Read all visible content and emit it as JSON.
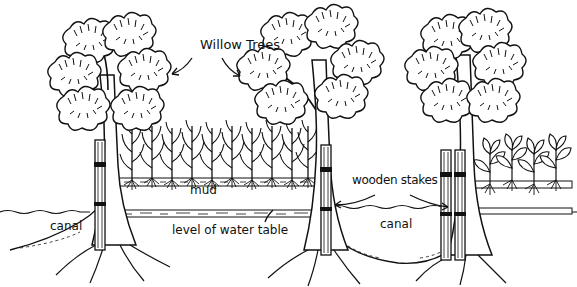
{
  "diagram": {
    "labels": {
      "willow_trees": "Willow Trees",
      "mud": "mud",
      "water_table": "level of water table",
      "wooden_stakes": "wooden stakes",
      "canal_left": "canal",
      "canal_center": "canal"
    },
    "elements": [
      {
        "name": "willow-tree",
        "count": 3
      },
      {
        "name": "wooden-stake",
        "count": 4
      },
      {
        "name": "canal",
        "count": 2
      },
      {
        "name": "crop-bed-corn",
        "count": 1
      },
      {
        "name": "crop-bed-leafy",
        "count": 1
      }
    ],
    "colors": {
      "ink": "#111111",
      "background": "#ffffff"
    }
  }
}
